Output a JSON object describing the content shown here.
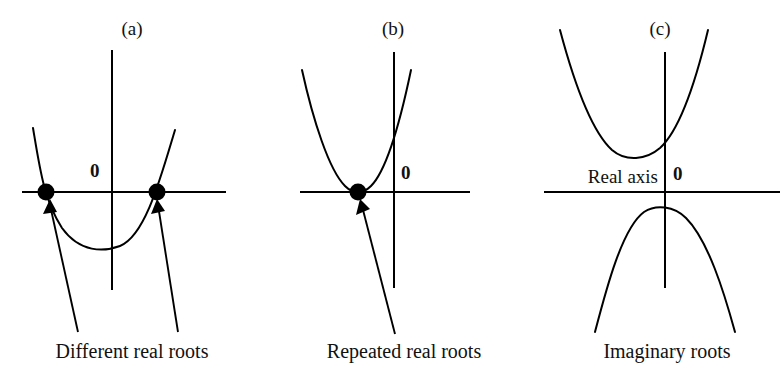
{
  "figure": {
    "background_color": "#ffffff",
    "stroke_color": "#000000",
    "width": 783,
    "height": 382
  },
  "panels": [
    {
      "id": "a",
      "label": "(a)",
      "origin_label": "0",
      "caption": "Different real roots",
      "case": "two distinct real roots",
      "root_count": 2,
      "parabola_direction": "opens-upward",
      "vertex_below_axis": true,
      "roots_marked": 2,
      "arrow_count": 2,
      "axis_name": ""
    },
    {
      "id": "b",
      "label": "(b)",
      "origin_label": "0",
      "caption": "Repeated real roots",
      "case": "one repeated real root",
      "root_count": 1,
      "parabola_direction": "opens-upward",
      "vertex_below_axis": false,
      "roots_marked": 1,
      "arrow_count": 1,
      "axis_name": ""
    },
    {
      "id": "c",
      "label": "(c)",
      "origin_label": "0",
      "caption": "Imaginary roots",
      "case": "no real roots",
      "root_count": 0,
      "parabola_direction": "upward-above-and-downward-below",
      "vertex_below_axis": false,
      "roots_marked": 0,
      "arrow_count": 0,
      "axis_name": "Real axis"
    }
  ]
}
